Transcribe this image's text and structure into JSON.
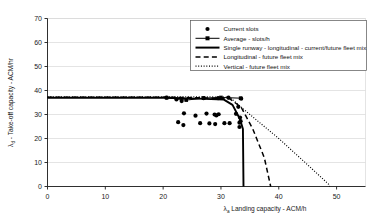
{
  "chart_data": {
    "type": "scatter",
    "title": "",
    "xlabel": "λa  Landing capacity - ACM/h",
    "ylabel": "λd - Take-off capacity - ACM/hr",
    "xlim": [
      0,
      55
    ],
    "ylim": [
      0,
      70
    ],
    "xticks": [
      0,
      10,
      20,
      30,
      40,
      50
    ],
    "yticks": [
      0,
      10,
      20,
      30,
      40,
      50,
      60,
      70
    ],
    "grid": "horizontal",
    "legend_position": "top-right",
    "series": [
      {
        "name": "Current slots",
        "style": "marker-only",
        "points": [
          [
            20.6,
            37.0
          ],
          [
            22.3,
            36.3
          ],
          [
            23.2,
            35.6
          ],
          [
            23.6,
            30.5
          ],
          [
            22.6,
            26.8
          ],
          [
            23.5,
            25.6
          ],
          [
            25.6,
            29.5
          ],
          [
            26.4,
            26.4
          ],
          [
            27.5,
            30.4
          ],
          [
            28.9,
            30.0
          ],
          [
            29.6,
            30.1
          ],
          [
            29.2,
            29.6
          ],
          [
            28.0,
            26.3
          ],
          [
            29.0,
            26.0
          ],
          [
            30.6,
            26.4
          ],
          [
            31.5,
            26.4
          ],
          [
            33.2,
            26.6
          ],
          [
            32.6,
            30.3
          ],
          [
            33.5,
            36.6
          ],
          [
            33.0,
            33.2
          ],
          [
            33.3,
            28.7
          ],
          [
            33.4,
            27.2
          ],
          [
            33.2,
            24.8
          ],
          [
            31.3,
            37.0
          ],
          [
            29.5,
            36.8
          ],
          [
            27.0,
            36.8
          ]
        ]
      },
      {
        "name": "Average - slots/h",
        "style": "line-marker",
        "points": [
          [
            20.6,
            37.0
          ],
          [
            24.0,
            36.0
          ],
          [
            27.0,
            36.8
          ],
          [
            30.0,
            37.1
          ],
          [
            33.4,
            36.8
          ]
        ]
      },
      {
        "name": "Single runway - longitudinal - current/future fleet mix",
        "style": "solid-thick",
        "points": [
          [
            0,
            37.0
          ],
          [
            20.0,
            37.0
          ],
          [
            26.0,
            36.6
          ],
          [
            30.5,
            36.2
          ],
          [
            32.0,
            34.0
          ],
          [
            33.3,
            28.0
          ],
          [
            33.8,
            24.0
          ],
          [
            33.9,
            0
          ]
        ]
      },
      {
        "name": "Longitudinal - future fleet mix",
        "style": "dashed",
        "points": [
          [
            0,
            37.2
          ],
          [
            21.0,
            37.2
          ],
          [
            27.0,
            36.9
          ],
          [
            31.5,
            36.6
          ],
          [
            33.5,
            33.0
          ],
          [
            35.5,
            24.0
          ],
          [
            37.5,
            12.0
          ],
          [
            38.6,
            0
          ]
        ]
      },
      {
        "name": "Vertical - future fleet mix",
        "style": "dotted",
        "points": [
          [
            0,
            37.4
          ],
          [
            26.0,
            37.4
          ],
          [
            31.5,
            37.2
          ],
          [
            35.0,
            30.0
          ],
          [
            40.0,
            20.0
          ],
          [
            45.0,
            9.0
          ],
          [
            48.6,
            1.0
          ],
          [
            48.8,
            0
          ]
        ]
      }
    ]
  },
  "legend": {
    "items": [
      {
        "label": "Current slots",
        "marker": "dot"
      },
      {
        "label": "Average - slots/h",
        "marker": "line-dot"
      },
      {
        "label": "Single runway - longitudinal - current/future fleet mix",
        "marker": "solid-thick"
      },
      {
        "label": "Longitudinal - future fleet mix",
        "marker": "dashed"
      },
      {
        "label": "Vertical - future fleet mix",
        "marker": "dotted"
      }
    ]
  },
  "axes": {
    "y_title_main": "- Take-off capacity - ACM/hr",
    "y_title_sym": "λ",
    "y_title_sub": "d",
    "x_title_main": "Landing capacity - ACM/h",
    "x_title_sym": "λ",
    "x_title_sub": "a",
    "xticks": [
      "0",
      "10",
      "20",
      "30",
      "40",
      "50"
    ],
    "yticks": [
      "0",
      "10",
      "20",
      "30",
      "40",
      "50",
      "60",
      "70"
    ]
  },
  "colors": {
    "axis": "#1a1a1a",
    "grid": "#d9d9d9",
    "series": "#000000",
    "background": "#ffffff"
  }
}
